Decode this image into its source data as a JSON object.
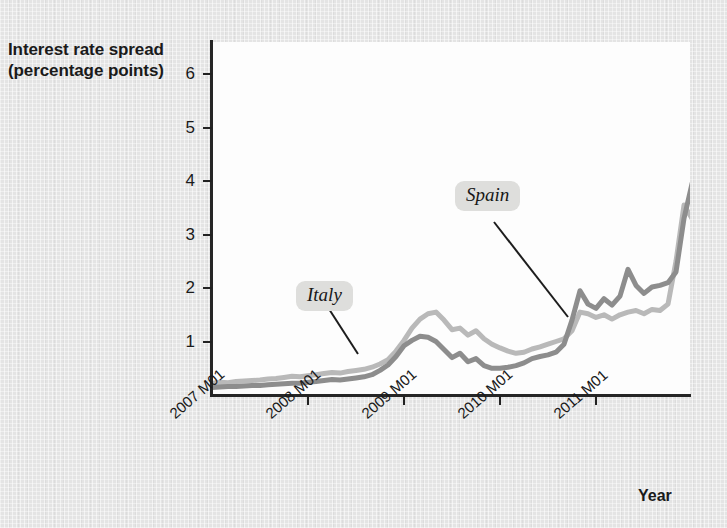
{
  "figure": {
    "y_axis_title_line1": "Interest rate spread",
    "y_axis_title_line2": "(percentage points)",
    "x_axis_title": "Year"
  },
  "annotations": [
    {
      "label": "Italy",
      "series": "Italy"
    },
    {
      "label": "Spain",
      "series": "Spain"
    }
  ],
  "colors": {
    "italy_line": "#b9b9b9",
    "spain_line": "#8d8d8d",
    "axis": "#262626",
    "plot_background": "#fdfdfd",
    "page_background": "#e4e4e4",
    "annotation_background": "#dededc"
  },
  "chart_data": {
    "type": "line",
    "title": "",
    "subtitle": "",
    "xlabel": "Year",
    "ylabel": "Interest rate spread (percentage points)",
    "xlim": [
      "2007 M01",
      "2011 M12"
    ],
    "ylim": [
      0,
      6.6
    ],
    "yticks": [
      1,
      2,
      3,
      4,
      5,
      6
    ],
    "ytick_labels": [
      "1",
      "2",
      "3",
      "4",
      "5",
      "6"
    ],
    "xticks": [
      "2007 M01",
      "2008 M01",
      "2009 M01",
      "2010 M01",
      "2011 M01"
    ],
    "xtick_labels": [
      "2007 M01",
      "2008 M01",
      "2009 M01",
      "2010 M01",
      "2011 M01"
    ],
    "grid": false,
    "legend": "none (direct labels on lines)",
    "x_index_note": "index 0 = 2007 M01, one step per month, 60 months to 2011 M12",
    "series": [
      {
        "name": "Italy",
        "color": "#b9b9b9",
        "values": [
          0.22,
          0.24,
          0.23,
          0.25,
          0.26,
          0.27,
          0.28,
          0.3,
          0.31,
          0.33,
          0.35,
          0.34,
          0.36,
          0.38,
          0.4,
          0.42,
          0.41,
          0.44,
          0.46,
          0.48,
          0.52,
          0.58,
          0.66,
          0.82,
          1.02,
          1.25,
          1.42,
          1.52,
          1.55,
          1.4,
          1.22,
          1.25,
          1.12,
          1.2,
          1.05,
          0.95,
          0.88,
          0.82,
          0.78,
          0.8,
          0.86,
          0.9,
          0.95,
          1.0,
          1.05,
          1.2,
          1.55,
          1.52,
          1.45,
          1.5,
          1.42,
          1.5,
          1.55,
          1.58,
          1.52,
          1.6,
          1.58,
          1.7,
          2.5,
          3.55,
          3.3,
          4.0,
          4.5,
          4.6,
          5.2
        ]
      },
      {
        "name": "Spain",
        "color": "#8d8d8d",
        "values": [
          0.14,
          0.15,
          0.16,
          0.16,
          0.17,
          0.18,
          0.18,
          0.19,
          0.2,
          0.21,
          0.22,
          0.22,
          0.24,
          0.25,
          0.27,
          0.29,
          0.28,
          0.3,
          0.32,
          0.34,
          0.38,
          0.46,
          0.56,
          0.72,
          0.92,
          1.02,
          1.1,
          1.08,
          1.0,
          0.85,
          0.7,
          0.78,
          0.62,
          0.68,
          0.55,
          0.5,
          0.5,
          0.52,
          0.55,
          0.6,
          0.68,
          0.72,
          0.75,
          0.8,
          0.95,
          1.4,
          1.95,
          1.7,
          1.62,
          1.8,
          1.68,
          1.85,
          2.35,
          2.05,
          1.9,
          2.02,
          2.05,
          2.1,
          2.3,
          3.3,
          3.95,
          3.7,
          4.4,
          3.6,
          4.25
        ]
      }
    ]
  }
}
